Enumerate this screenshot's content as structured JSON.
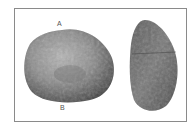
{
  "figure": {
    "label_a": "A",
    "label_b": "B",
    "colors": {
      "frame": "#8a8a8a",
      "stone_light": "#9a9a9a",
      "stone_dark": "#3a3a3a",
      "seed_mid": "#6a6a6a"
    }
  }
}
